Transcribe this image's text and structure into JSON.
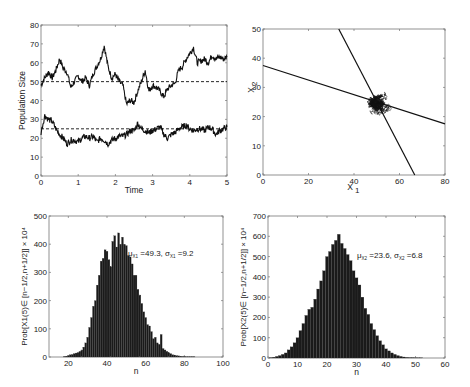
{
  "chart_data": [
    {
      "id": "time-series",
      "type": "line",
      "title": "",
      "xlabel": "Time",
      "ylabel": "Population Size",
      "xlim": [
        0,
        5
      ],
      "ylim": [
        0,
        80
      ],
      "xticks": [
        0,
        1,
        2,
        3,
        4,
        5
      ],
      "yticks": [
        0,
        10,
        20,
        30,
        40,
        50,
        60,
        70,
        80
      ],
      "grid": false,
      "reference_lines": [
        {
          "y": 50,
          "style": "dashed"
        },
        {
          "y": 25,
          "style": "dashed"
        }
      ],
      "series": [
        {
          "name": "X1",
          "x": [
            0,
            0.1,
            0.2,
            0.3,
            0.4,
            0.5,
            0.6,
            0.7,
            0.8,
            0.9,
            1.0,
            1.1,
            1.2,
            1.3,
            1.4,
            1.5,
            1.6,
            1.7,
            1.8,
            1.9,
            2.0,
            2.1,
            2.2,
            2.3,
            2.4,
            2.5,
            2.6,
            2.7,
            2.8,
            2.9,
            3.0,
            3.1,
            3.2,
            3.3,
            3.4,
            3.5,
            3.6,
            3.7,
            3.8,
            3.9,
            4.0,
            4.1,
            4.2,
            4.3,
            4.4,
            4.5,
            4.6,
            4.7,
            4.8,
            4.9,
            5.0
          ],
          "values": [
            48,
            52,
            55,
            52,
            56,
            62,
            57,
            55,
            47,
            50,
            53,
            50,
            52,
            48,
            54,
            58,
            62,
            69,
            58,
            52,
            54,
            50,
            48,
            38,
            40,
            39,
            45,
            50,
            56,
            45,
            48,
            47,
            45,
            42,
            46,
            48,
            49,
            56,
            58,
            62,
            65,
            68,
            60,
            61,
            62,
            60,
            64,
            62,
            63,
            62,
            63
          ]
        },
        {
          "name": "X2",
          "x": [
            0,
            0.1,
            0.2,
            0.3,
            0.4,
            0.5,
            0.6,
            0.7,
            0.8,
            0.9,
            1.0,
            1.1,
            1.2,
            1.3,
            1.4,
            1.5,
            1.6,
            1.7,
            1.8,
            1.9,
            2.0,
            2.1,
            2.2,
            2.3,
            2.4,
            2.5,
            2.6,
            2.7,
            2.8,
            2.9,
            3.0,
            3.1,
            3.2,
            3.3,
            3.4,
            3.5,
            3.6,
            3.7,
            3.8,
            3.9,
            4.0,
            4.1,
            4.2,
            4.3,
            4.4,
            4.5,
            4.6,
            4.7,
            4.8,
            4.9,
            5.0
          ],
          "values": [
            23,
            32,
            30,
            29,
            25,
            22,
            20,
            17,
            19,
            19,
            18,
            20,
            21,
            20,
            21,
            18,
            20,
            19,
            17,
            19,
            20,
            21,
            21,
            22,
            24,
            24,
            28,
            25,
            24,
            23,
            24,
            25,
            26,
            22,
            20,
            22,
            23,
            25,
            26,
            27,
            25,
            24,
            25,
            25,
            24,
            26,
            25,
            22,
            24,
            25,
            26
          ]
        }
      ]
    },
    {
      "id": "phase-plane",
      "type": "line",
      "title": "",
      "xlabel": "X1",
      "ylabel": "X2",
      "xlim": [
        0,
        80
      ],
      "ylim": [
        0,
        50
      ],
      "xticks": [
        0,
        20,
        40,
        60,
        80
      ],
      "yticks": [
        0,
        10,
        20,
        30,
        40,
        50
      ],
      "grid": false,
      "lines": [
        {
          "name": "nullcline-1",
          "points": [
            [
              0,
              37.5
            ],
            [
              80,
              17.5
            ]
          ]
        },
        {
          "name": "nullcline-2",
          "points": [
            [
              33.3,
              50
            ],
            [
              66.7,
              0
            ]
          ]
        }
      ],
      "trajectory_cloud": {
        "center": [
          50,
          24
        ],
        "x_range": [
          38,
          69
        ],
        "y_range": [
          16,
          32
        ]
      }
    },
    {
      "id": "histogram-x1",
      "type": "bar",
      "title": "",
      "xlabel": "n",
      "ylabel": "Prob[X1(5)∈[n−1/2,n+1/2]] × 10^4",
      "xlim": [
        10,
        100
      ],
      "ylim": [
        0,
        500
      ],
      "xticks": [
        20,
        40,
        60,
        80,
        100
      ],
      "yticks": [
        0,
        100,
        200,
        300,
        400,
        500
      ],
      "annotation": "μX1=49.3, σX1=9.2",
      "categories": [
        18,
        19,
        20,
        21,
        22,
        23,
        24,
        25,
        26,
        27,
        28,
        29,
        30,
        31,
        32,
        33,
        34,
        35,
        36,
        37,
        38,
        39,
        40,
        41,
        42,
        43,
        44,
        45,
        46,
        47,
        48,
        49,
        50,
        51,
        52,
        53,
        54,
        55,
        56,
        57,
        58,
        59,
        60,
        61,
        62,
        63,
        64,
        65,
        66,
        67,
        68,
        69,
        70,
        71,
        72,
        73,
        74,
        75,
        76,
        77,
        78,
        79,
        80,
        81,
        82,
        83,
        84,
        85
      ],
      "values": [
        2,
        3,
        5,
        8,
        9,
        12,
        14,
        16,
        20,
        25,
        35,
        50,
        70,
        105,
        140,
        180,
        200,
        255,
        290,
        340,
        350,
        380,
        375,
        345,
        320,
        410,
        430,
        390,
        440,
        400,
        425,
        400,
        395,
        360,
        355,
        330,
        290,
        290,
        240,
        220,
        190,
        160,
        140,
        115,
        110,
        90,
        65,
        70,
        50,
        45,
        80,
        30,
        25,
        20,
        15,
        12,
        8,
        7,
        5,
        4,
        3,
        2,
        2,
        1,
        1,
        1,
        1,
        1
      ]
    },
    {
      "id": "histogram-x2",
      "type": "bar",
      "title": "",
      "xlabel": "n",
      "ylabel": "Prob[X2(5)∈[n−1/2,n+1/2]] × 10^4",
      "xlim": [
        0,
        60
      ],
      "ylim": [
        0,
        700
      ],
      "xticks": [
        0,
        10,
        20,
        30,
        40,
        50,
        60
      ],
      "yticks": [
        0,
        100,
        200,
        300,
        400,
        500,
        600,
        700
      ],
      "annotation": "μX2=23.6, σX2=6.8",
      "categories": [
        1,
        2,
        3,
        4,
        5,
        6,
        7,
        8,
        9,
        10,
        11,
        12,
        13,
        14,
        15,
        16,
        17,
        18,
        19,
        20,
        21,
        22,
        23,
        24,
        25,
        26,
        27,
        28,
        29,
        30,
        31,
        32,
        33,
        34,
        35,
        36,
        37,
        38,
        39,
        40,
        41,
        42,
        43,
        44,
        45,
        46,
        47,
        48,
        49,
        50,
        51,
        52
      ],
      "values": [
        2,
        4,
        8,
        12,
        18,
        25,
        40,
        55,
        75,
        100,
        135,
        170,
        210,
        240,
        250,
        290,
        340,
        380,
        430,
        500,
        525,
        560,
        580,
        610,
        565,
        540,
        510,
        480,
        430,
        395,
        360,
        300,
        245,
        215,
        170,
        140,
        110,
        85,
        65,
        45,
        35,
        25,
        18,
        12,
        8,
        5,
        3,
        2,
        2,
        1,
        1,
        1
      ]
    }
  ],
  "plots": {
    "time_series": {
      "xlabel": "Time",
      "ylabel": "Population Size",
      "xtick_labels": [
        "0",
        "1",
        "2",
        "3",
        "4",
        "5"
      ],
      "ytick_labels": [
        "0",
        "10",
        "20",
        "30",
        "40",
        "50",
        "60",
        "70",
        "80"
      ]
    },
    "phase_plane": {
      "xlabel_main": "X",
      "xlabel_sub": "1",
      "ylabel_main": "X",
      "ylabel_sub": "2",
      "xtick_labels": [
        "0",
        "20",
        "40",
        "60",
        "80"
      ],
      "ytick_labels": [
        "0",
        "10",
        "20",
        "30",
        "40",
        "50"
      ]
    },
    "hist_x1": {
      "xlabel": "n",
      "ylabel": "Prob[X1(5)∈ [n−1/2,n+1/2]] × 10⁴",
      "annotation_mu": "μ",
      "annotation_sub": "X1",
      "annotation_text": "=49.3, σ",
      "annotation_text2": "=9.2",
      "xtick_labels": [
        "20",
        "40",
        "60",
        "80",
        "100"
      ],
      "ytick_labels": [
        "0",
        "100",
        "200",
        "300",
        "400",
        "500"
      ]
    },
    "hist_x2": {
      "xlabel": "n",
      "ylabel": "Prob[X2(5)∈ [n−1/2,n+1/2]] × 10⁴",
      "annotation_mu": "μ",
      "annotation_sub": "X2",
      "annotation_text": "=23.6, σ",
      "annotation_text2": "=6.8",
      "xtick_labels": [
        "0",
        "10",
        "20",
        "30",
        "40",
        "50",
        "60"
      ],
      "ytick_labels": [
        "0",
        "100",
        "200",
        "300",
        "400",
        "500",
        "600",
        "700"
      ]
    }
  },
  "colors": {
    "line": "#111111",
    "axis": "#777777",
    "bar": "#1a1a1a",
    "text": "#222222"
  }
}
